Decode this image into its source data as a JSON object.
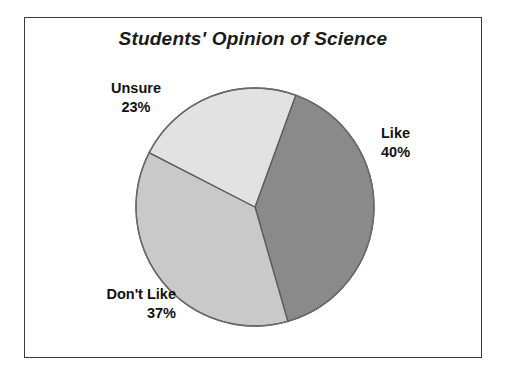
{
  "chart_data": {
    "type": "pie",
    "title": "Students' Opinion of Science",
    "xlabel": "",
    "ylabel": "",
    "legend_position": "none",
    "grid": false,
    "categories": [
      "Like",
      "Don't Like",
      "Unsure"
    ],
    "values": [
      40,
      37,
      23
    ],
    "value_unit": "%",
    "slices": [
      {
        "label": "Like",
        "percent_text": "40%",
        "value": 40,
        "color": "#8a8a8a",
        "start_angle_deg": 20,
        "end_angle_deg": 164,
        "label_position": "right"
      },
      {
        "label": "Don't Like",
        "percent_text": "37%",
        "value": 37,
        "color": "#c9c9c9",
        "start_angle_deg": 164,
        "end_angle_deg": 297.2,
        "label_position": "bottom-left"
      },
      {
        "label": "Unsure",
        "percent_text": "23%",
        "value": 23,
        "color": "#e2e2e2",
        "start_angle_deg": 297.2,
        "end_angle_deg": 380,
        "label_position": "top-left"
      }
    ],
    "geometry": {
      "center_x": 255,
      "center_y": 207,
      "radius": 119
    },
    "colors": {
      "like": "#8a8a8a",
      "dont_like": "#c9c9c9",
      "unsure": "#e2e2e2",
      "outline": "#5a5a5a",
      "frame": "#3a3a3a",
      "background": "#ffffff",
      "text": "#111111"
    }
  }
}
